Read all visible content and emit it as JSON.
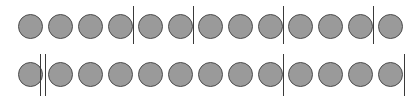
{
  "figure": {
    "width": 414,
    "height": 101,
    "background_color": "#ffffff",
    "token_fill_color": "#9a9a9a",
    "token_stroke_color": "#4d4d4d",
    "separator_color": "#3a3a3a",
    "token_diameter": 25,
    "token_count_total": 26,
    "separator_count_total": 7
  },
  "rows": [
    {
      "id": "row-1",
      "name": "top-row",
      "top": 0,
      "height": 50,
      "token_count": 13,
      "circle_top": 14,
      "tokens": [
        {
          "index": 1,
          "x": 18,
          "y": 14,
          "d": 25
        },
        {
          "index": 2,
          "x": 48,
          "y": 14,
          "d": 25
        },
        {
          "index": 3,
          "x": 78,
          "y": 14,
          "d": 25
        },
        {
          "index": 4,
          "x": 108,
          "y": 14,
          "d": 25
        },
        {
          "index": 5,
          "x": 138,
          "y": 14,
          "d": 25
        },
        {
          "index": 6,
          "x": 168,
          "y": 14,
          "d": 25
        },
        {
          "index": 7,
          "x": 198,
          "y": 14,
          "d": 25
        },
        {
          "index": 8,
          "x": 228,
          "y": 14,
          "d": 25
        },
        {
          "index": 9,
          "x": 258,
          "y": 14,
          "d": 25
        },
        {
          "index": 10,
          "x": 288,
          "y": 14,
          "d": 25
        },
        {
          "index": 11,
          "x": 318,
          "y": 14,
          "d": 25
        },
        {
          "index": 12,
          "x": 348,
          "y": 14,
          "d": 25
        },
        {
          "index": 13,
          "x": 378,
          "y": 14,
          "d": 25
        }
      ],
      "separators": [
        {
          "index": 1,
          "type": "single",
          "x": 133,
          "y": 6,
          "h": 38,
          "w": 1,
          "after_token": 4
        },
        {
          "index": 2,
          "type": "single",
          "x": 193,
          "y": 6,
          "h": 38,
          "w": 1,
          "after_token": 6
        },
        {
          "index": 3,
          "type": "single",
          "x": 283,
          "y": 6,
          "h": 38,
          "w": 1,
          "after_token": 9
        },
        {
          "index": 4,
          "type": "single",
          "x": 373,
          "y": 6,
          "h": 38,
          "w": 1,
          "after_token": 12
        }
      ]
    },
    {
      "id": "row-2",
      "name": "bottom-row",
      "top": 50,
      "height": 51,
      "token_count": 13,
      "circle_top": 12,
      "tokens": [
        {
          "index": 1,
          "x": 18,
          "y": 12,
          "d": 25
        },
        {
          "index": 2,
          "x": 48,
          "y": 12,
          "d": 25
        },
        {
          "index": 3,
          "x": 78,
          "y": 12,
          "d": 25
        },
        {
          "index": 4,
          "x": 108,
          "y": 12,
          "d": 25
        },
        {
          "index": 5,
          "x": 138,
          "y": 12,
          "d": 25
        },
        {
          "index": 6,
          "x": 168,
          "y": 12,
          "d": 25
        },
        {
          "index": 7,
          "x": 198,
          "y": 12,
          "d": 25
        },
        {
          "index": 8,
          "x": 228,
          "y": 12,
          "d": 25
        },
        {
          "index": 9,
          "x": 258,
          "y": 12,
          "d": 25
        },
        {
          "index": 10,
          "x": 288,
          "y": 12,
          "d": 25
        },
        {
          "index": 11,
          "x": 318,
          "y": 12,
          "d": 25
        },
        {
          "index": 12,
          "x": 348,
          "y": 12,
          "d": 25
        },
        {
          "index": 13,
          "x": 378,
          "y": 12,
          "d": 25
        }
      ],
      "separators": [
        {
          "index": 1,
          "type": "double",
          "x": 40,
          "y": 4,
          "h": 42,
          "w": 7,
          "gap": 5,
          "after_token": 1
        },
        {
          "index": 2,
          "type": "single",
          "x": 283,
          "y": 4,
          "h": 42,
          "w": 1,
          "after_token": 9
        },
        {
          "index": 3,
          "type": "single",
          "x": 404,
          "y": 4,
          "h": 42,
          "w": 1,
          "after_token": 13
        }
      ]
    }
  ]
}
